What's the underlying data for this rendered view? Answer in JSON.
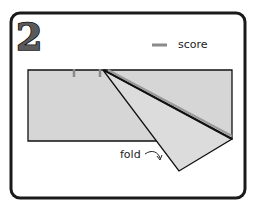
{
  "step_number": "2",
  "legend": {
    "score_label": "score"
  },
  "annotations": {
    "fold_label": "fold"
  },
  "colors": {
    "paper": "#d6d6d6",
    "flap": "#dcdcdc",
    "outline": "#111111",
    "score_mark": "#8a8a8a",
    "frame": "#1a1a1a",
    "background": "#ffffff"
  }
}
